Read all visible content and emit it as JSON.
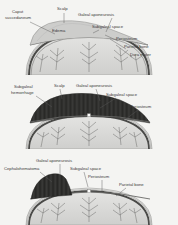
{
  "figure": {
    "type": "medical-illustration",
    "style": "grayscale line drawing, cross-section of infant skull",
    "panel_count": 3
  },
  "colors": {
    "background": "#f4f4f2",
    "skull_fill": "#d8d8d6",
    "bone_dark": "#4a4a4a",
    "hemorrhage_dark": "#2e2e2e",
    "swelling_fill": "#c9c9c7",
    "label_text": "#3a3a3a",
    "leader_line": "#5a5a5a"
  },
  "panels": [
    {
      "id": "caput-succedaneum",
      "condition": "Caput succedaneum",
      "labels": [
        {
          "key": "caput",
          "text": "Caput",
          "x": 12,
          "y": 13
        },
        {
          "key": "caput2",
          "text": "succedaneum",
          "x": 5,
          "y": 19
        },
        {
          "key": "scalp",
          "text": "Scalp",
          "x": 57,
          "y": 10
        },
        {
          "key": "galeal",
          "text": "Galeal aponeurosis",
          "x": 78,
          "y": 16
        },
        {
          "key": "subgaleal",
          "text": "Subgaleal space",
          "x": 92,
          "y": 28
        },
        {
          "key": "edema",
          "text": "Edema",
          "x": 52,
          "y": 32
        },
        {
          "key": "periosteum",
          "text": "Periosteum",
          "x": 116,
          "y": 40
        },
        {
          "key": "parietal",
          "text": "Parietal bone",
          "x": 124,
          "y": 48
        },
        {
          "key": "dura",
          "text": "Dura mater",
          "x": 130,
          "y": 56
        }
      ]
    },
    {
      "id": "subgaleal-hemorrhage",
      "condition": "Subgaleal hemorrhage",
      "labels": [
        {
          "key": "subg1",
          "text": "Subgaleal",
          "x": 14,
          "y": 13
        },
        {
          "key": "subg2",
          "text": "hemorrhage",
          "x": 11,
          "y": 19
        },
        {
          "key": "scalp",
          "text": "Scalp",
          "x": 54,
          "y": 12
        },
        {
          "key": "galeal",
          "text": "Galeal aponeurosis",
          "x": 76,
          "y": 12
        },
        {
          "key": "subspace",
          "text": "Subgaleal space",
          "x": 106,
          "y": 21
        },
        {
          "key": "periosteum",
          "text": "Periosteum",
          "x": 130,
          "y": 33
        }
      ]
    },
    {
      "id": "cephalohematoma",
      "condition": "Cephalohematoma",
      "labels": [
        {
          "key": "galeal",
          "text": "Galeal aponeurosis",
          "x": 36,
          "y": 13
        },
        {
          "key": "cephalo",
          "text": "Cephalohematoma",
          "x": 6,
          "y": 21
        },
        {
          "key": "subspace",
          "text": "Subgaleal space",
          "x": 70,
          "y": 21
        },
        {
          "key": "periosteum",
          "text": "Periosteum",
          "x": 88,
          "y": 29
        },
        {
          "key": "parietal",
          "text": "Parietal bone",
          "x": 119,
          "y": 37
        }
      ]
    }
  ]
}
